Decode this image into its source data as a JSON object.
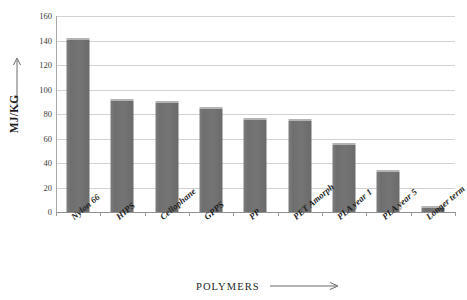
{
  "chart_data": {
    "type": "bar",
    "title": "",
    "xlabel": "POLYMERS",
    "ylabel": "MJ/KG",
    "ylim": [
      0,
      160
    ],
    "ytick_step": 20,
    "yticks": [
      0,
      20,
      40,
      60,
      80,
      100,
      120,
      140,
      160
    ],
    "grid": true,
    "legend": "none",
    "categories": [
      "Nylon 66",
      "HIPS",
      "Cellophane",
      "GPPS",
      "PP",
      "PET Amorph",
      "PLA year 1",
      "PLA year 5",
      "Longer term"
    ],
    "values": [
      142,
      92,
      91,
      86,
      77,
      76,
      56,
      34,
      5
    ],
    "bar_color": "#737373",
    "grid_color": "#d2d2d2",
    "axis_color": "#8f8f8f"
  },
  "axes": {
    "y_title": "MJ/KG",
    "y_arrow_icon": "up-arrow-icon",
    "x_title": "POLYMERS",
    "x_arrow_icon": "right-arrow-icon"
  }
}
